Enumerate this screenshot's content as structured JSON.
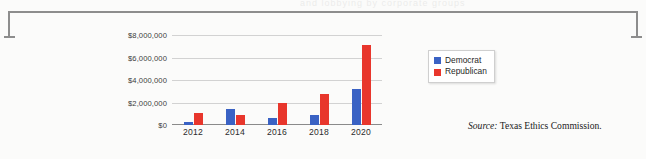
{
  "frame": {
    "bleed_text": "and lobbying by corporate groups"
  },
  "legend": {
    "items": [
      {
        "label": "Democrat",
        "color": "#3a62c4"
      },
      {
        "label": "Republican",
        "color": "#e8362c"
      }
    ]
  },
  "source": {
    "prefix": "Source:",
    "text": " Texas Ethics Commission."
  },
  "chart_data": {
    "type": "bar",
    "title": "",
    "xlabel": "",
    "ylabel": "",
    "categories": [
      "2012",
      "2014",
      "2016",
      "2018",
      "2020"
    ],
    "series": [
      {
        "name": "Democrat",
        "color": "#3a62c4",
        "values": [
          300000,
          1400000,
          600000,
          900000,
          3200000
        ]
      },
      {
        "name": "Republican",
        "color": "#e8362c",
        "values": [
          1100000,
          900000,
          1950000,
          2800000,
          7100000
        ]
      }
    ],
    "ylim": [
      0,
      8000000
    ],
    "ytick_values": [
      8000000,
      6000000,
      4000000,
      2000000,
      0
    ],
    "ytick_labels": [
      "$8,000,000",
      "$6,000,000",
      "$4,000,000",
      "$2,000,000",
      "$0"
    ],
    "grid": true,
    "legend_position": "right"
  }
}
